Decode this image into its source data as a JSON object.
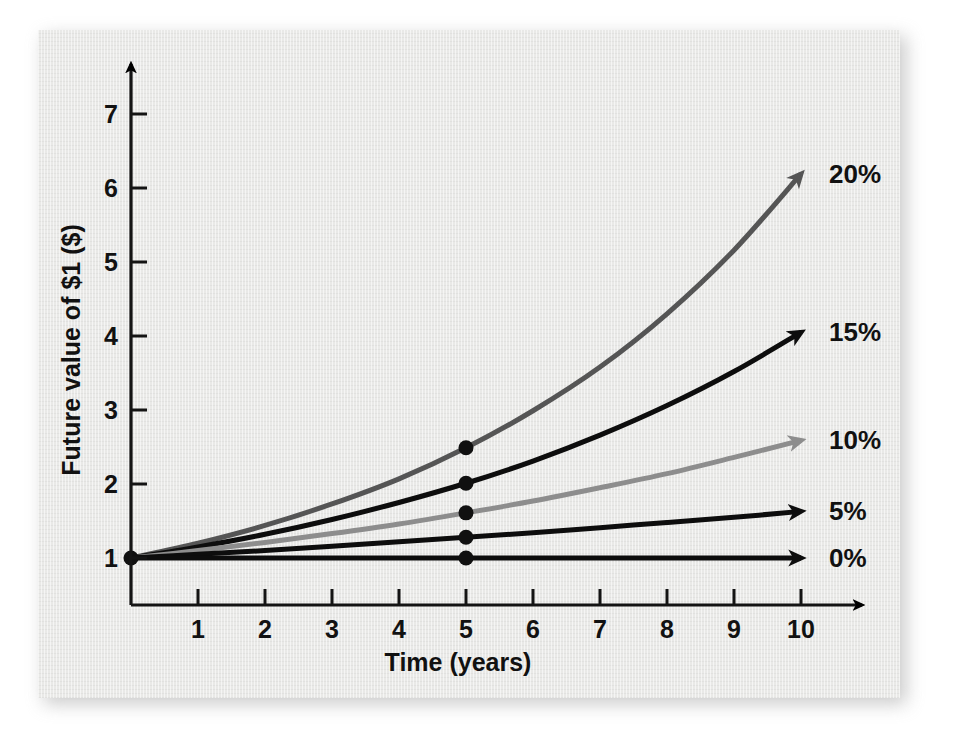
{
  "figure": {
    "background_color": "#e9e9e7",
    "axis_color": "#141414"
  },
  "chart_data": {
    "type": "line",
    "title": "",
    "xlabel": "Time (years)",
    "ylabel": "Future value of $1 ($)",
    "xlim": [
      0,
      10.6
    ],
    "ylim": [
      1,
      7.6
    ],
    "grid": false,
    "legend_position": "right-end-of-line",
    "x_ticks": [
      1,
      2,
      3,
      4,
      5,
      6,
      7,
      8,
      9,
      10
    ],
    "x_tick_labels": [
      "1",
      "2",
      "3",
      "4",
      "5",
      "6",
      "7",
      "8",
      "9",
      "10"
    ],
    "y_ticks": [
      1,
      2,
      3,
      4,
      5,
      6,
      7
    ],
    "y_tick_labels": [
      "1",
      "2",
      "3",
      "4",
      "5",
      "6",
      "7"
    ],
    "x": [
      0,
      1,
      2,
      3,
      4,
      5,
      6,
      7,
      8,
      9,
      10
    ],
    "annotations": [
      {
        "text": "marker at year 5 on every series",
        "x": 5
      }
    ],
    "series": [
      {
        "name": "20%",
        "label": "20%",
        "color": "#555555",
        "line_width": 5,
        "values": [
          1.0,
          1.2,
          1.44,
          1.73,
          2.07,
          2.49,
          2.99,
          3.58,
          4.3,
          5.16,
          6.19
        ],
        "marker_x": 5,
        "marker_y": 2.49
      },
      {
        "name": "15%",
        "label": "15%",
        "color": "#0d0d0d",
        "line_width": 5,
        "values": [
          1.0,
          1.15,
          1.32,
          1.52,
          1.75,
          2.01,
          2.31,
          2.66,
          3.06,
          3.52,
          4.05
        ],
        "marker_x": 5,
        "marker_y": 2.01
      },
      {
        "name": "10%",
        "label": "10%",
        "color": "#8d8d8d",
        "line_width": 5,
        "values": [
          1.0,
          1.1,
          1.21,
          1.33,
          1.46,
          1.61,
          1.77,
          1.95,
          2.14,
          2.36,
          2.59
        ],
        "marker_x": 5,
        "marker_y": 1.61
      },
      {
        "name": "5%",
        "label": "5%",
        "color": "#0d0d0d",
        "line_width": 5,
        "values": [
          1.0,
          1.05,
          1.1,
          1.16,
          1.22,
          1.28,
          1.34,
          1.41,
          1.48,
          1.55,
          1.63
        ],
        "marker_x": 5,
        "marker_y": 1.28
      },
      {
        "name": "0%",
        "label": "0%",
        "color": "#0d0d0d",
        "line_width": 5,
        "values": [
          1.0,
          1.0,
          1.0,
          1.0,
          1.0,
          1.0,
          1.0,
          1.0,
          1.0,
          1.0,
          1.0
        ],
        "marker_x": 5,
        "marker_y": 1.0
      }
    ]
  }
}
